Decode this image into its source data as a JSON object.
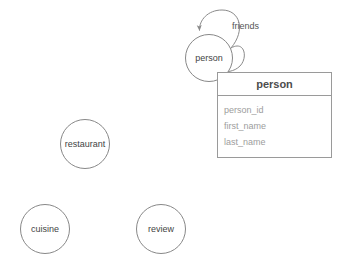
{
  "diagram": {
    "type": "entity-relationship-graph",
    "background_color": "#ffffff",
    "node_stroke_color": "#888888",
    "edge_stroke_color": "#8a8a8a",
    "nodes": [
      {
        "id": "person",
        "label": "person",
        "cx": 209,
        "cy": 58,
        "r": 24
      },
      {
        "id": "restaurant",
        "label": "restaurant",
        "cx": 85,
        "cy": 144,
        "r": 25
      },
      {
        "id": "cuisine",
        "label": "cuisine",
        "cx": 45,
        "cy": 229,
        "r": 25
      },
      {
        "id": "review",
        "label": "review",
        "cx": 161,
        "cy": 229,
        "r": 25
      }
    ],
    "edges": [
      {
        "id": "friends",
        "label": "friends",
        "from": "person",
        "to": "person",
        "self_loop": true,
        "label_x": 232,
        "label_y": 22,
        "arrow": true
      }
    ]
  },
  "table": {
    "title": "person",
    "title_color": "#4d4d4d",
    "field_color": "#9d9d9d",
    "border_color": "#9a9a9a",
    "x": 217,
    "y": 72,
    "width": 115,
    "height": 86,
    "fields": [
      {
        "name": "person_id"
      },
      {
        "name": "first_name"
      },
      {
        "name": "last_name"
      }
    ]
  }
}
